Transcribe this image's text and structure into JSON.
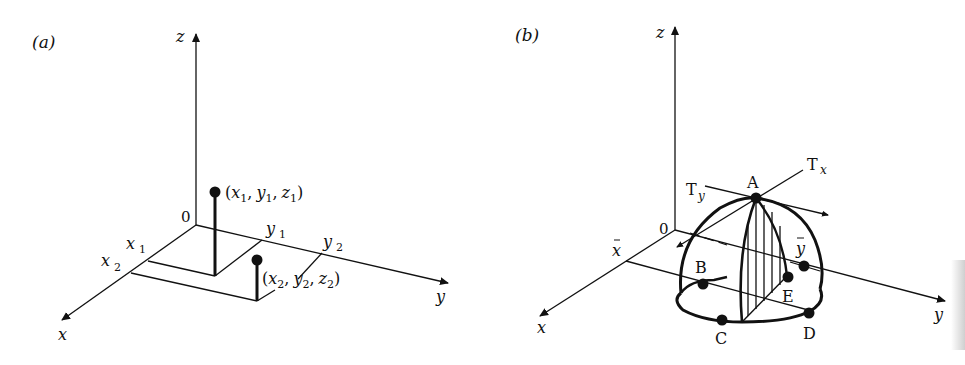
{
  "figure": {
    "panel_a": {
      "label": "(a)",
      "axes": {
        "x": "x",
        "y": "y",
        "z": "z",
        "origin": "0"
      },
      "ticks": {
        "x1": "x",
        "x1_sub": "1",
        "x2": "x",
        "x2_sub": "2",
        "y1": "y",
        "y1_sub": "1",
        "y2": "y",
        "y2_sub": "2"
      },
      "points": [
        {
          "open": "(",
          "x": "x",
          "xs": "1",
          "y": "y",
          "ys": "1",
          "z": "z",
          "zs": "1",
          "close": ")"
        },
        {
          "open": "(",
          "x": "x",
          "xs": "2",
          "y": "y",
          "ys": "2",
          "z": "z",
          "zs": "2",
          "close": ")"
        }
      ],
      "comma": ","
    },
    "panel_b": {
      "label": "(b)",
      "axes": {
        "x": "x",
        "y": "y",
        "z": "z",
        "origin": "0"
      },
      "centroid": {
        "xbar": "x",
        "ybar": "y"
      },
      "tangents": {
        "tx": "T",
        "tx_sub": "x",
        "ty": "T",
        "ty_sub": "y"
      },
      "points": [
        "A",
        "B",
        "C",
        "D",
        "E"
      ]
    },
    "colors": {
      "ink": "#111111",
      "paper": "#ffffff"
    }
  }
}
